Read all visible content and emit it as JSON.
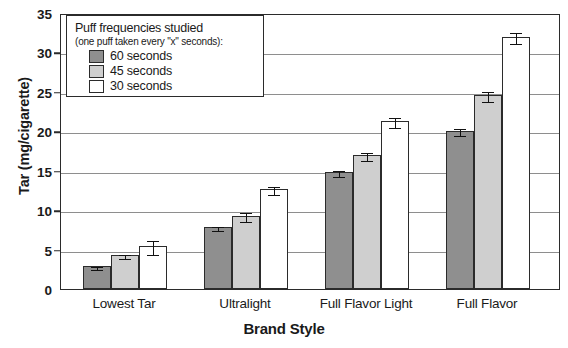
{
  "chart_data": {
    "type": "bar",
    "title": "",
    "xlabel": "Brand Style",
    "ylabel": "Tar (mg/cigarette)",
    "categories": [
      "Lowest Tar",
      "Ultralight",
      "Full Flavor Light",
      "Full Flavor"
    ],
    "ylim": [
      0,
      35
    ],
    "yticks": [
      0,
      5,
      10,
      15,
      20,
      25,
      30,
      35
    ],
    "ytick_labels": [
      "0",
      "5",
      "10",
      "15",
      "20",
      "25",
      "30",
      "35"
    ],
    "grid": true,
    "grid_axis": "y",
    "legend_position": "upper-left-inside",
    "series": [
      {
        "name": "60 seconds",
        "color": "#8f8f8f",
        "values": [
          2.9,
          7.9,
          14.8,
          20.1
        ],
        "errors": [
          0.2,
          0.25,
          0.4,
          0.4
        ]
      },
      {
        "name": "45 seconds",
        "color": "#cfcfcf",
        "values": [
          4.3,
          9.3,
          17.0,
          24.6
        ],
        "errors": [
          0.25,
          0.55,
          0.5,
          0.6
        ]
      },
      {
        "name": "30 seconds",
        "color": "#ffffff",
        "values": [
          5.5,
          12.7,
          21.3,
          32.0
        ],
        "errors": [
          0.9,
          0.5,
          0.6,
          0.7
        ]
      }
    ]
  },
  "legend": {
    "title": "Puff frequencies studied",
    "subtitle": "(one puff taken every \"x\" seconds):",
    "items": [
      {
        "label": "60 seconds",
        "swatch": "s60"
      },
      {
        "label": "45 seconds",
        "swatch": "s45"
      },
      {
        "label": "30 seconds",
        "swatch": "s30"
      }
    ]
  },
  "axes": {
    "y_title": "Tar (mg/cigarette)",
    "x_title": "Brand Style"
  },
  "colors": {
    "series_60": "#8f8f8f",
    "series_45": "#cfcfcf",
    "series_30": "#ffffff",
    "axis": "#2b2b2b",
    "grid": "#8e8e8e"
  }
}
